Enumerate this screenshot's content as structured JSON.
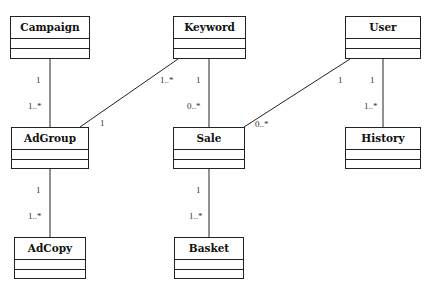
{
  "diagram": {
    "type": "UML class diagram",
    "classes": [
      {
        "id": "campaign",
        "name": "Campaign",
        "x": 10,
        "y": 16,
        "w": 80,
        "h": 43
      },
      {
        "id": "keyword",
        "name": "Keyword",
        "x": 173,
        "y": 16,
        "w": 73,
        "h": 43
      },
      {
        "id": "user",
        "name": "User",
        "x": 345,
        "y": 16,
        "w": 76,
        "h": 43
      },
      {
        "id": "adgroup",
        "name": "AdGroup",
        "x": 11,
        "y": 127,
        "w": 78,
        "h": 42
      },
      {
        "id": "sale",
        "name": "Sale",
        "x": 173,
        "y": 127,
        "w": 72,
        "h": 42
      },
      {
        "id": "history",
        "name": "History",
        "x": 345,
        "y": 127,
        "w": 76,
        "h": 42
      },
      {
        "id": "adcopy",
        "name": "AdCopy",
        "x": 14,
        "y": 237,
        "w": 72,
        "h": 42
      },
      {
        "id": "basket",
        "name": "Basket",
        "x": 174,
        "y": 237,
        "w": 70,
        "h": 42
      }
    ],
    "associations": [
      {
        "from": "Campaign",
        "to": "AdGroup",
        "from_mult": "1",
        "to_mult": "1..*"
      },
      {
        "from": "Keyword",
        "to": "AdGroup",
        "from_mult": "1..*",
        "to_mult": "1"
      },
      {
        "from": "Keyword",
        "to": "Sale",
        "from_mult": "1",
        "to_mult": "0..*"
      },
      {
        "from": "User",
        "to": "Sale",
        "from_mult": "1",
        "to_mult": "0..*"
      },
      {
        "from": "User",
        "to": "History",
        "from_mult": "1",
        "to_mult": "1..*"
      },
      {
        "from": "AdGroup",
        "to": "AdCopy",
        "from_mult": "1",
        "to_mult": "1..*"
      },
      {
        "from": "Sale",
        "to": "Basket",
        "from_mult": "1",
        "to_mult": "1..*"
      }
    ],
    "labels": {
      "campaign_adgroup_top": "1",
      "campaign_adgroup_bottom": "1..*",
      "keyword_adgroup_top": "1..*",
      "keyword_adgroup_bottom": "1",
      "keyword_sale_top": "1",
      "keyword_sale_bottom": "0..*",
      "user_sale_top": "1",
      "user_sale_bottom": "0..*",
      "user_history_top": "1",
      "user_history_bottom": "1..*",
      "adgroup_adcopy_top": "1",
      "adgroup_adcopy_bottom": "1..*",
      "sale_basket_top": "1",
      "sale_basket_bottom": "1..*"
    },
    "colors": {
      "line": "#222222",
      "text": "#111111",
      "background": "#ffffff"
    }
  }
}
